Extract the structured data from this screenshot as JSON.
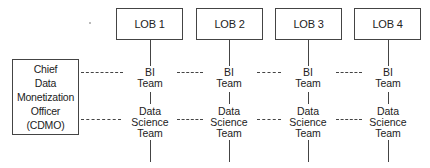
{
  "cdmo": {
    "lines": [
      "Chief",
      "Data",
      "Monetization",
      "Officer",
      "(CDMO)"
    ]
  },
  "lobs": [
    {
      "label": "LOB 1",
      "bi": [
        "BI",
        "Team"
      ],
      "ds": [
        "Data",
        "Science",
        "Team"
      ]
    },
    {
      "label": "LOB 2",
      "bi": [
        "BI",
        "Team"
      ],
      "ds": [
        "Data",
        "Science",
        "Team"
      ]
    },
    {
      "label": "LOB 3",
      "bi": [
        "BI",
        "Team"
      ],
      "ds": [
        "Data",
        "Science",
        "Team"
      ]
    },
    {
      "label": "LOB 4",
      "bi": [
        "BI",
        "Team"
      ],
      "ds": [
        "Data",
        "Science",
        "Team"
      ]
    }
  ]
}
